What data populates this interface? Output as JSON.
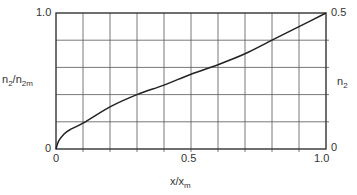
{
  "chart_data": {
    "type": "line",
    "title": "",
    "xlabel": "x/x_m",
    "ylabel": "n_2/n_2m",
    "ylabel_right": "n_2",
    "xlim": [
      0,
      1.0
    ],
    "ylim": [
      0,
      1.0
    ],
    "ylim_right": [
      0,
      0.5
    ],
    "grid": true,
    "x_ticks": [
      "0",
      "0.5",
      "1.0"
    ],
    "y_ticks_left": [
      "0",
      "1.0"
    ],
    "y_ticks_right": [
      "0",
      "0.5"
    ],
    "x_grid_divisions": 10,
    "y_grid_divisions": 5,
    "series": [
      {
        "name": "n_2/n_2m",
        "x": [
          0,
          0.01,
          0.03,
          0.05,
          0.1,
          0.2,
          0.3,
          0.4,
          0.5,
          0.6,
          0.7,
          0.8,
          0.9,
          1.0
        ],
        "y": [
          0,
          0.06,
          0.11,
          0.14,
          0.19,
          0.31,
          0.4,
          0.47,
          0.55,
          0.62,
          0.7,
          0.8,
          0.9,
          1.0
        ]
      }
    ]
  },
  "labels": {
    "y_left_top": "1.0",
    "y_left_bottom": "0",
    "y_right_top": "0.5",
    "y_right_bottom": "0",
    "x_left": "0",
    "x_mid": "0.5",
    "x_right": "1.0",
    "ylabel_main": "n",
    "ylabel_sub1": "2",
    "ylabel_slash": "/n",
    "ylabel_sub2": "2m",
    "ylabel_right_main": "n",
    "ylabel_right_sub": "2",
    "xlabel_main": "x/x",
    "xlabel_sub": "m"
  },
  "colors": {
    "line": "#222222",
    "grid": "#555555",
    "background": "#ffffff"
  }
}
